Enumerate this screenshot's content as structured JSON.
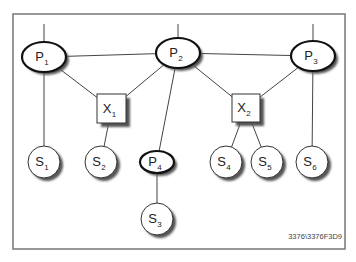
{
  "diagram": {
    "type": "network-topology",
    "frame": {
      "x": 13,
      "y": 14,
      "w": 332,
      "h": 235,
      "stroke": "#777777"
    },
    "colors": {
      "line": "#444444",
      "shadow": "#555555",
      "fill": "#ffffff"
    },
    "nodes": {
      "P1": {
        "kind": "ellipse",
        "letter": "P",
        "index": "1",
        "cx": 44,
        "cy": 57,
        "rx": 22,
        "ry": 15
      },
      "P2": {
        "kind": "ellipse",
        "letter": "P",
        "index": "2",
        "cx": 178,
        "cy": 53,
        "rx": 22,
        "ry": 15
      },
      "P3": {
        "kind": "ellipse",
        "letter": "P",
        "index": "3",
        "cx": 313,
        "cy": 56,
        "rx": 22,
        "ry": 15
      },
      "P4": {
        "kind": "ellipse",
        "letter": "P",
        "index": "4",
        "cx": 157,
        "cy": 162,
        "rx": 17,
        "ry": 11
      },
      "X1": {
        "kind": "box",
        "letter": "X",
        "index": "1",
        "x": 97,
        "y": 94,
        "w": 29,
        "h": 29
      },
      "X2": {
        "kind": "box",
        "letter": "X",
        "index": "2",
        "x": 232,
        "y": 94,
        "w": 28,
        "h": 28
      },
      "S1": {
        "kind": "circle",
        "letter": "S",
        "index": "1",
        "cx": 44,
        "cy": 162,
        "r": 16
      },
      "S2": {
        "kind": "circle",
        "letter": "S",
        "index": "2",
        "cx": 101,
        "cy": 162,
        "r": 16
      },
      "S3": {
        "kind": "circle",
        "letter": "S",
        "index": "3",
        "cx": 157,
        "cy": 219,
        "r": 16
      },
      "S4": {
        "kind": "circle",
        "letter": "S",
        "index": "4",
        "cx": 226,
        "cy": 162,
        "r": 16
      },
      "S5": {
        "kind": "circle",
        "letter": "S",
        "index": "5",
        "cx": 267,
        "cy": 162,
        "r": 16
      },
      "S6": {
        "kind": "circle",
        "letter": "S",
        "index": "6",
        "cx": 312,
        "cy": 162,
        "r": 16
      }
    },
    "edges": [
      {
        "from": "P1",
        "to": "P2"
      },
      {
        "from": "P2",
        "to": "P3"
      },
      {
        "from": "P1",
        "to": "X1"
      },
      {
        "from": "P2",
        "to": "X1"
      },
      {
        "from": "P2",
        "to": "X2"
      },
      {
        "from": "P3",
        "to": "X2"
      },
      {
        "from": "P2",
        "to": "P4"
      },
      {
        "from": "P1",
        "to": "S1"
      },
      {
        "from": "X1",
        "to": "S2"
      },
      {
        "from": "P4",
        "to": "S3"
      },
      {
        "from": "X2",
        "to": "S4"
      },
      {
        "from": "X2",
        "to": "S5"
      },
      {
        "from": "P3",
        "to": "S6"
      }
    ],
    "external_links": [
      "P1",
      "P2",
      "P3"
    ],
    "figure_code": "3376\\3376F3D9"
  }
}
